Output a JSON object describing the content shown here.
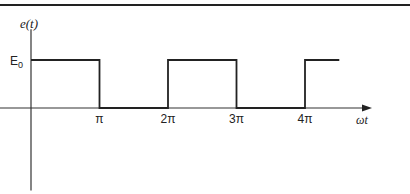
{
  "chart_data": {
    "type": "line",
    "title": "",
    "xlabel": "ωt",
    "ylabel": "e(t)",
    "x_ticks": [
      {
        "value": 1,
        "label": "π"
      },
      {
        "value": 2,
        "label": "2π"
      },
      {
        "value": 3,
        "label": "3π"
      },
      {
        "value": 4,
        "label": "4π"
      }
    ],
    "y_ticks": [
      {
        "value": 1,
        "label": "E0",
        "base": "E",
        "sub": "0"
      }
    ],
    "x_unit": "π",
    "xlim": [
      0,
      5.5
    ],
    "ylim": [
      -1.3,
      1.6
    ],
    "grid": false,
    "series": [
      {
        "name": "e(t)",
        "points": [
          [
            0,
            1
          ],
          [
            1,
            1
          ],
          [
            1,
            0
          ],
          [
            2,
            0
          ],
          [
            2,
            1
          ],
          [
            3,
            1
          ],
          [
            3,
            0
          ],
          [
            4,
            0
          ],
          [
            4,
            1
          ],
          [
            4.5,
            1
          ]
        ]
      }
    ]
  }
}
